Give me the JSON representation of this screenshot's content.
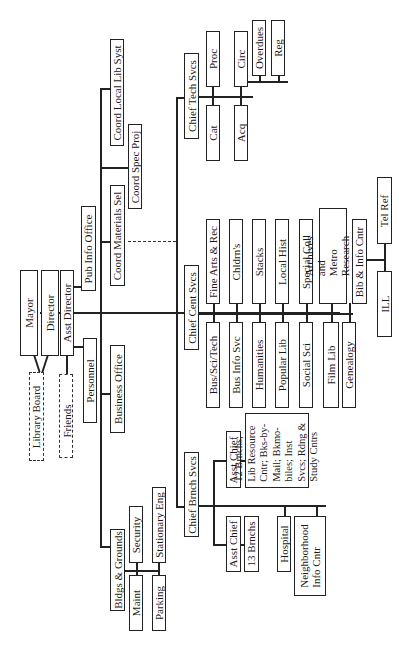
{
  "chart_title": "Library Organization Chart",
  "nodes": {
    "mayor": "Mayor",
    "director": "Director",
    "asst_director": "Asst Director",
    "library_board": "Library Board",
    "friends": "Friends",
    "personnel": "Personnel",
    "business_office": "Business Office",
    "pub_info_office": "Pub Info Office",
    "coord_materials_sel": "Coord Materials Sel",
    "coord_spec_proj": "Coord Spec Proj",
    "coord_local_lib_syst": "Coord Local Lib Syst",
    "bldgs_grounds": "Bldgs & Grounds",
    "maint": "Maint",
    "security": "Security",
    "parking": "Parking",
    "stationary_eng": "Stationary Eng",
    "chief_tech_svcs": "Chief Tech Svcs",
    "proc": "Proc",
    "cat": "Cat",
    "circ": "Circ",
    "acq": "Acq",
    "overdues": "Overdues",
    "reg": "Reg",
    "chief_cent_svcs": "Chief Cent Svcs",
    "fine_arts_rec": "Fine Arts & Rec",
    "bus_sci_tech": "Bus/Sci/Tech",
    "childrens": "Chldrn's",
    "bus_info_svc": "Bus Info Svc",
    "stacks": "Stacks",
    "humanities": "Humanities",
    "local_hist": "Local Hist",
    "popular_lib": "Popular Lib",
    "special_coll": "Special Coll",
    "social_sci": "Social Sci",
    "archives_line1": "Archives and Metro",
    "archives_line2": "Research Cntr",
    "film_lib": "Film Lib",
    "genealogy": "Genealogy",
    "bib_info_cntr": "Bib & Info Cntr",
    "tel_ref": "Tel Ref",
    "ill": "ILL",
    "chief_brnch_svcs": "Chief Brnch Svcs",
    "asst_chief_a": "Asst Chief",
    "branches_12": "12 Brnchs; Lib Resource Cntr; Bks-by-Mail; Bkmo-biles; Inst Svcs; Rdng & Study Cntrs",
    "asst_chief_b": "Asst Chief",
    "branches_13": "13 Brnchs",
    "hospital": "Hospital",
    "neighborhood_line1": "Neighborhood",
    "neighborhood_line2": "Info Cntr"
  }
}
